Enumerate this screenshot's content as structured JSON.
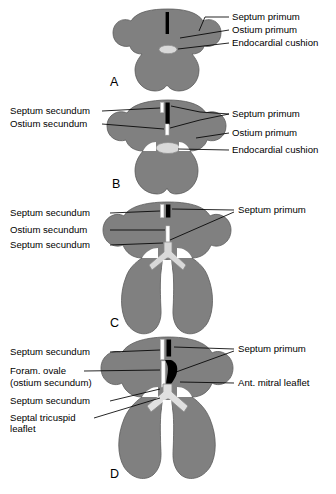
{
  "figure": {
    "background_color": "#ffffff",
    "tissue_color": "#808080",
    "tissue_outline_color": "#5c5c5c",
    "septum_primum_color": "#000000",
    "cushion_color": "#d9d9d9",
    "ostium_color": "#ffffff",
    "leader_color": "#000000"
  },
  "panels": [
    {
      "id": "A",
      "letter": "A",
      "letter_x": 110,
      "letter_y": 86,
      "labels_left": [],
      "labels_right": [
        {
          "text": "Septum primum",
          "x": 232,
          "y": 20,
          "leader": "M225,17 L205,17 L200,28"
        },
        {
          "text": "Ostium primum",
          "x": 232,
          "y": 33,
          "leader": "M225,30 L182,39"
        },
        {
          "text": "Endocardial cushion",
          "x": 232,
          "y": 46,
          "leader": "M225,43 L196,49"
        }
      ]
    },
    {
      "id": "B",
      "letter": "B",
      "letter_x": 112,
      "letter_y": 188,
      "labels_left": [
        {
          "text": "Septum secundum",
          "x": 10,
          "y": 114,
          "leader": "M100,111 L176,110"
        },
        {
          "text": "Ostium secundum",
          "x": 10,
          "y": 127,
          "leader": "M100,124 L184,124"
        }
      ],
      "labels_right": [
        {
          "text": "Septum primum",
          "x": 232,
          "y": 116,
          "leader": "M225,113 L200,112 L187,106 M225,113 L200,122 L186,128"
        },
        {
          "text": "Ostium primum",
          "x": 232,
          "y": 138,
          "leader": "M225,135 L196,133"
        },
        {
          "text": "Endocardial cushion",
          "x": 232,
          "y": 155,
          "leader": "M225,152 L190,148"
        }
      ]
    },
    {
      "id": "C",
      "letter": "C",
      "letter_x": 110,
      "letter_y": 327,
      "labels_left": [
        {
          "text": "Septum secundum",
          "x": 10,
          "y": 216,
          "leader": "M108,213 L167,212"
        },
        {
          "text": "Ostium secundum",
          "x": 10,
          "y": 233,
          "leader": "M108,230 L172,231"
        },
        {
          "text": "Septum secundum",
          "x": 10,
          "y": 248,
          "leader": "M108,245 L168,243"
        }
      ],
      "labels_right": [
        {
          "text": "Septum primum",
          "x": 238,
          "y": 213,
          "leader": "M232,210 L186,209 M232,213 L172,238"
        }
      ]
    },
    {
      "id": "D",
      "letter": "D",
      "letter_x": 110,
      "letter_y": 478,
      "labels_left": [
        {
          "text": "Septum secundum",
          "x": 10,
          "y": 355,
          "leader": "M108,352 L168,352"
        },
        {
          "text": "Foram. ovale",
          "x": 10,
          "y": 374,
          "leader": "M82,371 L168,370"
        },
        {
          "text": "(ostium secundum)",
          "x": 10,
          "y": 386,
          "leader": ""
        },
        {
          "text": "Septum secundum",
          "x": 10,
          "y": 404,
          "leader": "M108,401 L164,392"
        },
        {
          "text": "Septal tricuspid",
          "x": 10,
          "y": 421,
          "leader": "M92,418 L166,400"
        },
        {
          "text": "leaflet",
          "x": 10,
          "y": 432,
          "leader": ""
        }
      ],
      "labels_right": [
        {
          "text": "Septum primum",
          "x": 238,
          "y": 352,
          "leader": "M232,349 L186,348 M232,352 L176,374"
        },
        {
          "text": "Ant. mitral leaflet",
          "x": 238,
          "y": 386,
          "leader": "M232,383 L182,383"
        }
      ]
    }
  ]
}
